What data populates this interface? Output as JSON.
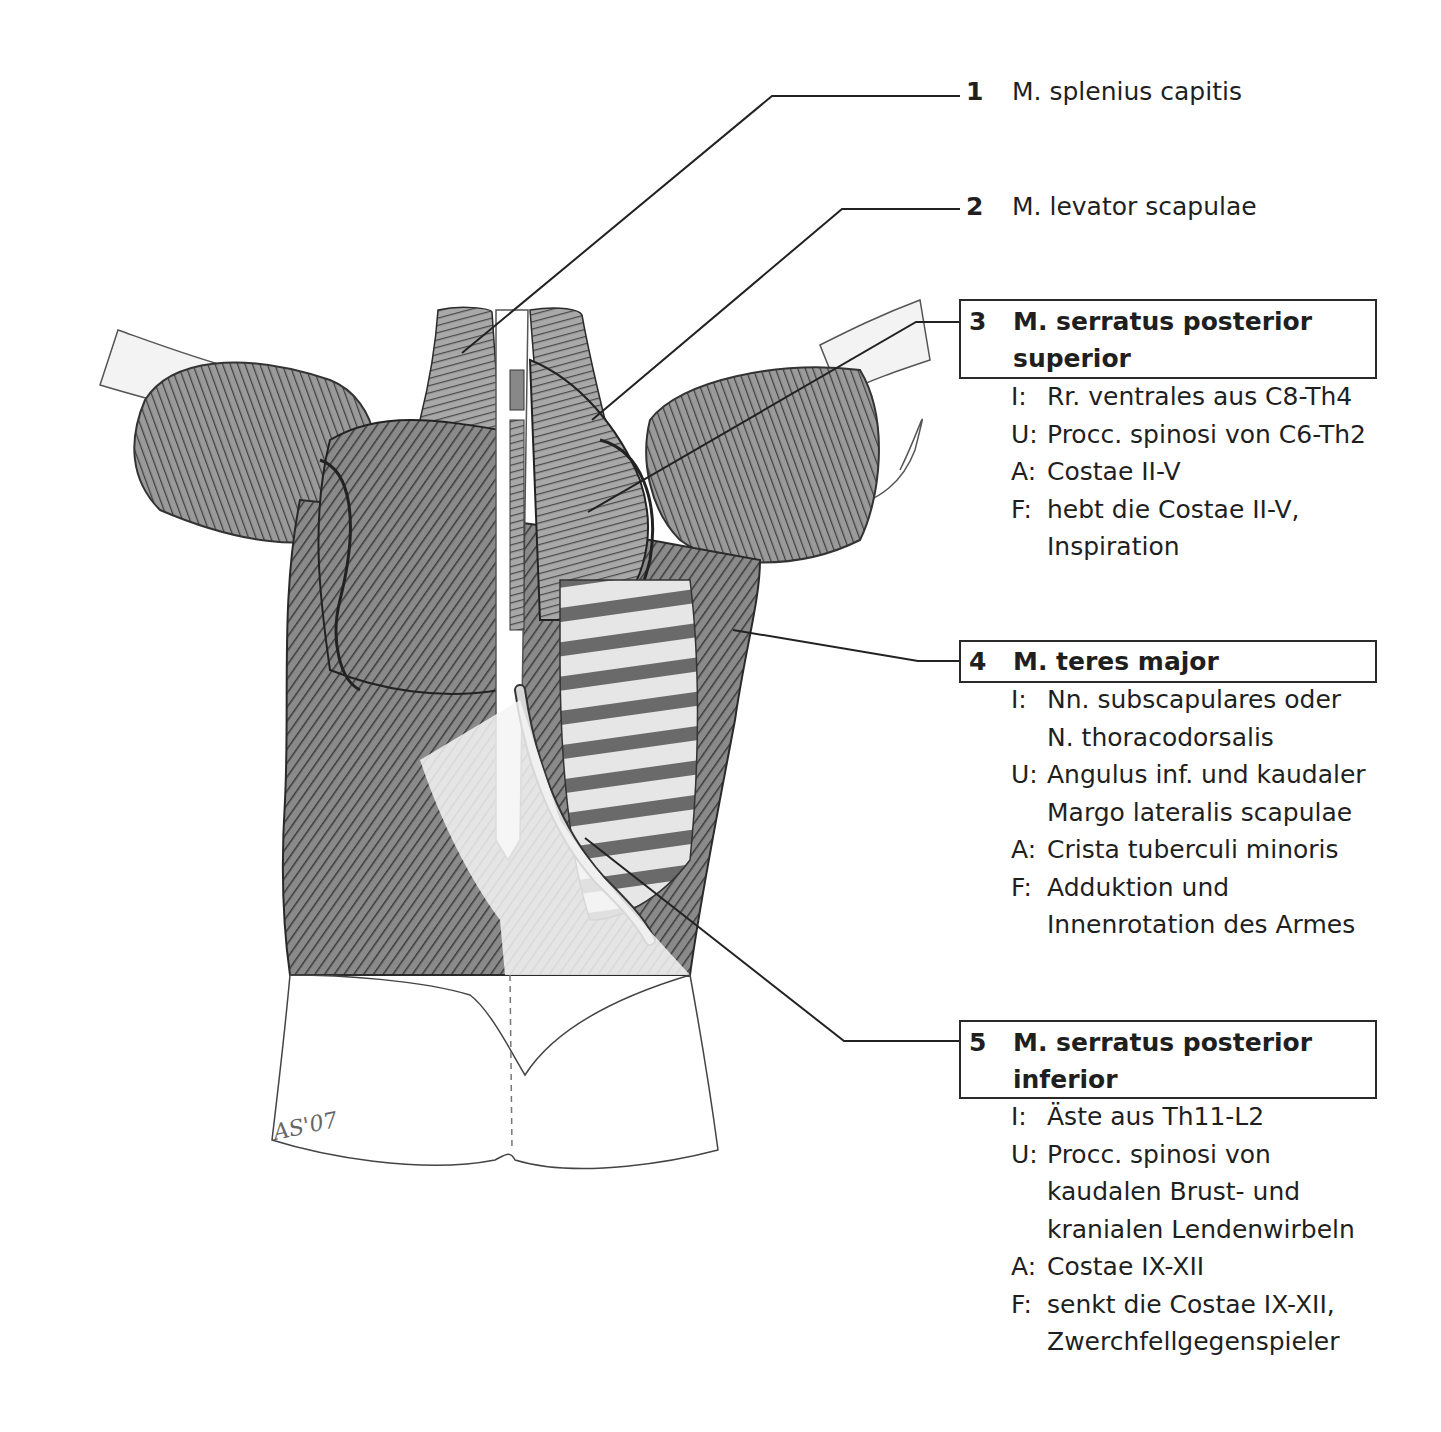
{
  "figure": {
    "signature": "AS'07",
    "colors": {
      "ink": "#1f1f1f",
      "leader": "#222222",
      "box_border": "#2a2a2a",
      "background": "#ffffff"
    }
  },
  "labels": [
    {
      "num": "1",
      "title": "M. splenius capitis",
      "boxed": false
    },
    {
      "num": "2",
      "title": "M. levator scapulae",
      "boxed": false
    },
    {
      "num": "3",
      "title": "M. serratus posterior superior",
      "boxed": true,
      "details": [
        {
          "key": "I:",
          "lines": [
            "Rr. ventrales aus C8-Th4"
          ]
        },
        {
          "key": "U:",
          "lines": [
            "Procc. spinosi von C6-Th2"
          ]
        },
        {
          "key": "A:",
          "lines": [
            "Costae II-V"
          ]
        },
        {
          "key": "F:",
          "lines": [
            "hebt die Costae II-V,",
            "Inspiration"
          ]
        }
      ]
    },
    {
      "num": "4",
      "title": "M. teres major",
      "boxed": true,
      "details": [
        {
          "key": "I:",
          "lines": [
            "Nn. subscapulares oder",
            "N. thoracodorsalis"
          ]
        },
        {
          "key": "U:",
          "lines": [
            "Angulus inf. und kaudaler",
            "Margo lateralis scapulae"
          ]
        },
        {
          "key": "A:",
          "lines": [
            "Crista tuberculi minoris"
          ]
        },
        {
          "key": "F:",
          "lines": [
            "Adduktion und",
            "Innenrotation des Armes"
          ]
        }
      ]
    },
    {
      "num": "5",
      "title": "M. serratus posterior inferior",
      "boxed": true,
      "details": [
        {
          "key": "I:",
          "lines": [
            "Äste aus Th11-L2"
          ]
        },
        {
          "key": "U:",
          "lines": [
            "Procc. spinosi von",
            "kaudalen Brust- und",
            "kranialen Lendenwirbeln"
          ]
        },
        {
          "key": "A:",
          "lines": [
            "Costae IX-XII"
          ]
        },
        {
          "key": "F:",
          "lines": [
            "senkt die Costae IX-XII,",
            "Zwerchfellgegenspieler"
          ]
        }
      ]
    }
  ]
}
